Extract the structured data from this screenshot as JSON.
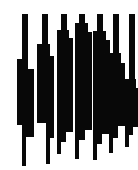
{
  "figure": {
    "width": 138,
    "height": 170,
    "background_color": "#ffffff",
    "ink_color": "#080808",
    "bar_count": 7
  },
  "chart_data": {
    "type": "bar",
    "title": "",
    "subtitle": "",
    "xlabel": "",
    "ylabel": "",
    "grid": false,
    "legend": null,
    "orientation": "vertical",
    "axis_ranges": {
      "x": [
        0,
        138
      ],
      "y": [
        0,
        170
      ]
    },
    "categories": [
      "b1",
      "b2",
      "b3",
      "b4",
      "b5",
      "b6",
      "b7"
    ],
    "values": [
      152,
      150,
      140,
      145,
      146,
      139,
      133
    ],
    "bars": [
      {
        "name": "b1",
        "center_x": 25,
        "top": 14,
        "bottom": 166,
        "segments": [
          {
            "y": 14,
            "h": 45,
            "x": 22,
            "w": 6
          },
          {
            "y": 59,
            "h": 10,
            "x": 17,
            "w": 11
          },
          {
            "y": 69,
            "h": 56,
            "x": 17,
            "w": 17
          },
          {
            "y": 125,
            "h": 12,
            "x": 22,
            "w": 12
          },
          {
            "y": 137,
            "h": 29,
            "x": 22,
            "w": 4
          }
        ]
      },
      {
        "name": "b2",
        "center_x": 45,
        "top": 14,
        "bottom": 164,
        "segments": [
          {
            "y": 14,
            "h": 30,
            "x": 42,
            "w": 6
          },
          {
            "y": 44,
            "h": 12,
            "x": 37,
            "w": 13
          },
          {
            "y": 56,
            "h": 67,
            "x": 37,
            "w": 17
          },
          {
            "y": 123,
            "h": 15,
            "x": 46,
            "w": 8
          },
          {
            "y": 138,
            "h": 26,
            "x": 46,
            "w": 4
          }
        ]
      },
      {
        "name": "b3",
        "center_x": 64,
        "top": 14,
        "bottom": 154,
        "segments": [
          {
            "y": 14,
            "h": 16,
            "x": 61,
            "w": 6
          },
          {
            "y": 30,
            "h": 8,
            "x": 57,
            "w": 12
          },
          {
            "y": 38,
            "h": 94,
            "x": 57,
            "w": 16
          },
          {
            "y": 132,
            "h": 10,
            "x": 57,
            "w": 9
          },
          {
            "y": 142,
            "h": 12,
            "x": 57,
            "w": 4
          }
        ]
      },
      {
        "name": "b4",
        "center_x": 82,
        "top": 14,
        "bottom": 159,
        "segments": [
          {
            "y": 14,
            "h": 9,
            "x": 79,
            "w": 6
          },
          {
            "y": 23,
            "h": 9,
            "x": 75,
            "w": 13
          },
          {
            "y": 32,
            "h": 98,
            "x": 75,
            "w": 17
          },
          {
            "y": 130,
            "h": 10,
            "x": 75,
            "w": 10
          },
          {
            "y": 140,
            "h": 19,
            "x": 75,
            "w": 4
          }
        ]
      },
      {
        "name": "b5",
        "center_x": 100,
        "top": 14,
        "bottom": 160,
        "segments": [
          {
            "y": 14,
            "h": 17,
            "x": 97,
            "w": 6
          },
          {
            "y": 31,
            "h": 9,
            "x": 93,
            "w": 13
          },
          {
            "y": 40,
            "h": 94,
            "x": 93,
            "w": 17
          },
          {
            "y": 134,
            "h": 10,
            "x": 93,
            "w": 9
          },
          {
            "y": 144,
            "h": 16,
            "x": 93,
            "w": 4
          }
        ]
      },
      {
        "name": "b6",
        "center_x": 116,
        "top": 14,
        "bottom": 153,
        "segments": [
          {
            "y": 14,
            "h": 39,
            "x": 113,
            "w": 6
          },
          {
            "y": 53,
            "h": 10,
            "x": 109,
            "w": 12
          },
          {
            "y": 63,
            "h": 63,
            "x": 109,
            "w": 16
          },
          {
            "y": 126,
            "h": 12,
            "x": 109,
            "w": 9
          },
          {
            "y": 138,
            "h": 15,
            "x": 109,
            "w": 4
          }
        ]
      },
      {
        "name": "b7",
        "center_x": 132,
        "top": 14,
        "bottom": 147,
        "segments": [
          {
            "y": 14,
            "h": 65,
            "x": 129,
            "w": 6
          },
          {
            "y": 79,
            "h": 9,
            "x": 125,
            "w": 11
          },
          {
            "y": 88,
            "h": 39,
            "x": 125,
            "w": 13
          },
          {
            "y": 127,
            "h": 8,
            "x": 125,
            "w": 8
          },
          {
            "y": 135,
            "h": 12,
            "x": 125,
            "w": 4
          }
        ]
      }
    ]
  }
}
